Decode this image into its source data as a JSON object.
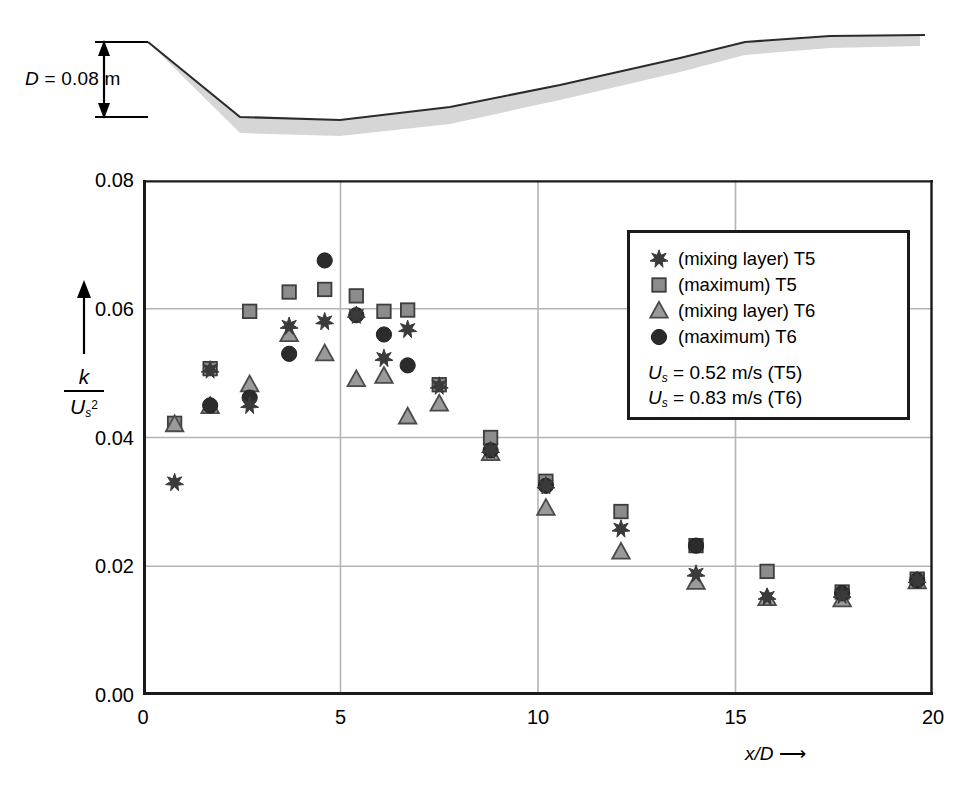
{
  "figure": {
    "bed_dimension_label": "D = 0.08 m",
    "bed_dimension_symbol": "D",
    "bed_dimension_value": "0.08 m"
  },
  "axes": {
    "x": {
      "label": "x/D",
      "arrow": "⟶",
      "ticks": [
        "0",
        "5",
        "10",
        "15",
        "20"
      ],
      "tick_values": [
        0,
        5,
        10,
        15,
        20
      ],
      "min": 0,
      "max": 20
    },
    "y": {
      "label_numerator": "k",
      "label_denominator": "U",
      "label_denominator_sub": "s",
      "label_denominator_pow": "2",
      "ticks": [
        "0.00",
        "0.02",
        "0.04",
        "0.06",
        "0.08"
      ],
      "tick_values": [
        0.0,
        0.02,
        0.04,
        0.06,
        0.08
      ],
      "min": 0.0,
      "max": 0.08
    }
  },
  "legend": {
    "entries": [
      {
        "marker": "star",
        "label": "(mixing layer) T5",
        "color": "#3a3a3a"
      },
      {
        "marker": "square",
        "label": "(maximum) T5",
        "color": "#8c8c8c"
      },
      {
        "marker": "triangle",
        "label": "(mixing layer) T6",
        "color": "#9a9a9a"
      },
      {
        "marker": "circle",
        "label": "(maximum) T6",
        "color": "#2b2b2b"
      }
    ],
    "notes": [
      {
        "symbol": "U",
        "sub": "s",
        "text": " = 0.52 m/s (T5)"
      },
      {
        "symbol": "U",
        "sub": "s",
        "text": " = 0.83 m/s (T6)"
      }
    ]
  },
  "chart_data": {
    "type": "scatter",
    "title": "",
    "xlabel": "x/D",
    "ylabel": "k/Us^2",
    "xlim": [
      0,
      20
    ],
    "ylim": [
      0.0,
      0.08
    ],
    "grid": true,
    "legend_position": "top-right",
    "series": [
      {
        "name": "(mixing layer) T5",
        "marker": "star",
        "color": "#3a3a3a",
        "points": [
          [
            0.8,
            0.033
          ],
          [
            1.7,
            0.0505
          ],
          [
            2.7,
            0.045
          ],
          [
            3.7,
            0.0573
          ],
          [
            4.6,
            0.058
          ],
          [
            5.4,
            0.059
          ],
          [
            6.1,
            0.0523
          ],
          [
            6.7,
            0.0568
          ],
          [
            7.5,
            0.048
          ],
          [
            8.8,
            0.038
          ],
          [
            10.2,
            0.0325
          ],
          [
            12.1,
            0.0258
          ],
          [
            14.0,
            0.0188
          ],
          [
            15.8,
            0.0152
          ],
          [
            17.7,
            0.0155
          ],
          [
            19.6,
            0.0178
          ]
        ]
      },
      {
        "name": "(maximum) T5",
        "marker": "square",
        "color": "#8c8c8c",
        "points": [
          [
            0.8,
            0.0422
          ],
          [
            1.7,
            0.0507
          ],
          [
            2.7,
            0.0596
          ],
          [
            3.7,
            0.0626
          ],
          [
            4.6,
            0.063
          ],
          [
            5.4,
            0.062
          ],
          [
            6.1,
            0.0596
          ],
          [
            6.7,
            0.0598
          ],
          [
            7.5,
            0.0482
          ],
          [
            8.8,
            0.04
          ],
          [
            10.2,
            0.0332
          ],
          [
            12.1,
            0.0285
          ],
          [
            14.0,
            0.0232
          ],
          [
            15.8,
            0.0192
          ],
          [
            17.7,
            0.016
          ],
          [
            19.6,
            0.018
          ]
        ]
      },
      {
        "name": "(mixing layer) T6",
        "marker": "triangle",
        "color": "#9a9a9a",
        "points": [
          [
            0.8,
            0.042
          ],
          [
            1.7,
            0.0448
          ],
          [
            2.7,
            0.0482
          ],
          [
            3.7,
            0.056
          ],
          [
            4.6,
            0.053
          ],
          [
            5.4,
            0.049
          ],
          [
            6.1,
            0.0495
          ],
          [
            6.7,
            0.0432
          ],
          [
            7.5,
            0.0452
          ],
          [
            8.8,
            0.0375
          ],
          [
            10.2,
            0.029
          ],
          [
            12.1,
            0.0222
          ],
          [
            14.0,
            0.0175
          ],
          [
            15.8,
            0.015
          ],
          [
            17.7,
            0.0148
          ],
          [
            19.6,
            0.0176
          ]
        ]
      },
      {
        "name": "(maximum) T6",
        "marker": "circle",
        "color": "#2b2b2b",
        "points": [
          [
            1.7,
            0.045
          ],
          [
            2.7,
            0.0462
          ],
          [
            3.7,
            0.053
          ],
          [
            4.6,
            0.0675
          ],
          [
            5.4,
            0.059
          ],
          [
            6.1,
            0.056
          ],
          [
            6.7,
            0.0512
          ],
          [
            8.8,
            0.038
          ],
          [
            10.2,
            0.0325
          ],
          [
            14.0,
            0.0232
          ],
          [
            17.7,
            0.0158
          ],
          [
            19.6,
            0.0178
          ]
        ]
      }
    ]
  },
  "bed_profile": {
    "top_points": "148,42 240,117 340,120 450,107 560,85 680,58 745,42 830,36 920,35",
    "bottom_points": "920,46 830,48 745,55 680,72 560,100 450,124 340,136 240,133 148,42",
    "fill_color": "#d6d6d6",
    "line_color": "#2b2b2b"
  }
}
